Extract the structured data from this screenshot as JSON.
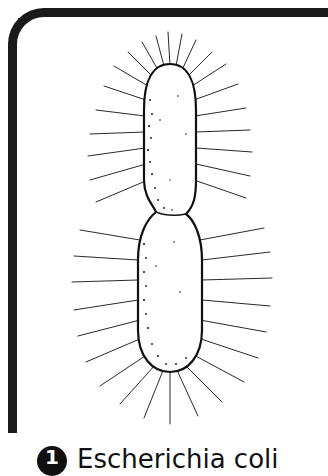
{
  "figure": {
    "border_color": "#1a1a1a",
    "ink_color": "#111111"
  },
  "caption": {
    "badge_number": "1",
    "text": "Escherichia coli"
  },
  "icons": {
    "badge": "numbered-circle-icon",
    "illustration": "bacterium-illustration"
  }
}
